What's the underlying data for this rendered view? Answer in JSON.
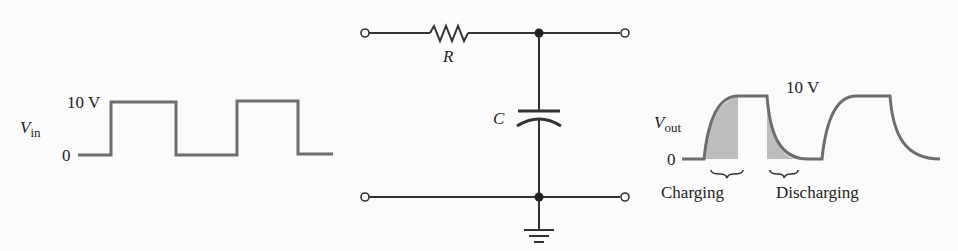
{
  "input_waveform": {
    "label_main": "V",
    "label_sub": "in",
    "high_label": "10 V",
    "low_label": "0",
    "color": "#6d6d6d"
  },
  "circuit": {
    "resistor_label": "R",
    "capacitor_label": "C",
    "wire_color": "#333333"
  },
  "output_waveform": {
    "label_main": "V",
    "label_sub": "out",
    "high_label": "10 V",
    "low_label": "0",
    "charging_label": "Charging",
    "discharging_label": "Discharging",
    "curve_color": "#6d6d6d",
    "shade_color": "#bdbdbd"
  }
}
